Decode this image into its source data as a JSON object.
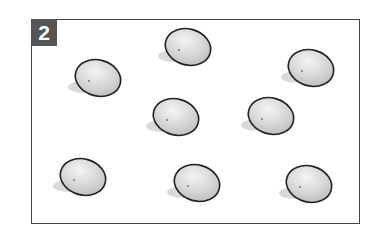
{
  "panel": {
    "number_label": "2"
  },
  "eggs": [
    {
      "cx": 98,
      "cy": 78
    },
    {
      "cx": 188,
      "cy": 47
    },
    {
      "cx": 311,
      "cy": 68
    },
    {
      "cx": 176,
      "cy": 117
    },
    {
      "cx": 271,
      "cy": 116
    },
    {
      "cx": 83,
      "cy": 177
    },
    {
      "cx": 197,
      "cy": 183
    },
    {
      "cx": 309,
      "cy": 184
    }
  ],
  "colors": {
    "frame": "#444444",
    "badge_bg": "#555555",
    "egg_fill": "#d8d8d8",
    "egg_outline": "#222222",
    "shadow": "#cfcfcf"
  }
}
